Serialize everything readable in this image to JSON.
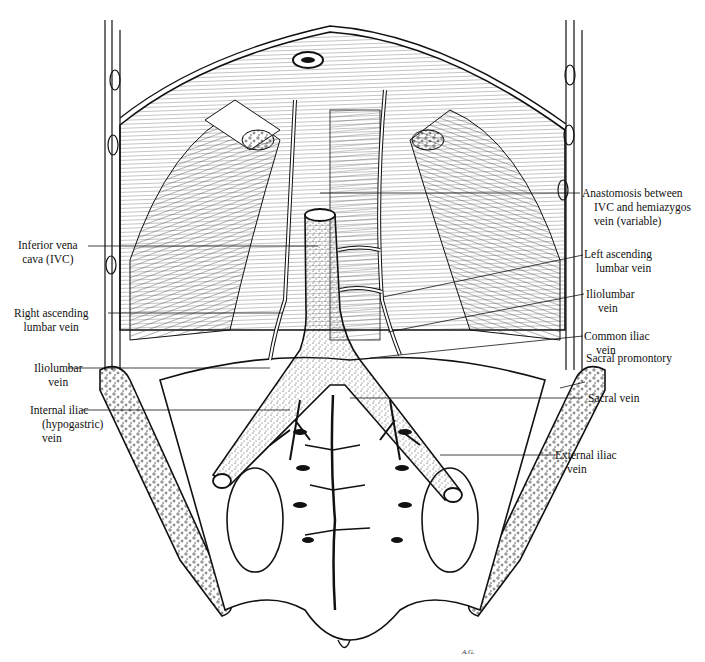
{
  "figure": {
    "artist_initials": "A.G."
  },
  "labels_left": [
    {
      "id": "ivc",
      "lines": [
        "Inferior vena",
        "cava (IVC)"
      ]
    },
    {
      "id": "right-ascending-lumbar",
      "lines": [
        "Right ascending",
        "lumbar vein"
      ]
    },
    {
      "id": "iliolumbar-left",
      "lines": [
        "Iliolumbar",
        "vein"
      ]
    },
    {
      "id": "internal-iliac",
      "lines": [
        "Internal iliac",
        "(hypogastric)",
        "vein"
      ]
    }
  ],
  "labels_right": [
    {
      "id": "anastomosis",
      "lines": [
        "Anastomosis between",
        "IVC and hemiazygos",
        "vein (variable)"
      ]
    },
    {
      "id": "left-ascending-lumbar",
      "lines": [
        "Left ascending",
        "lumbar vein"
      ]
    },
    {
      "id": "iliolumbar-right",
      "lines": [
        "Iliolumbar",
        "vein"
      ]
    },
    {
      "id": "common-iliac",
      "lines": [
        "Common iliac",
        "vein"
      ]
    },
    {
      "id": "sacral-promontory",
      "lines": [
        "Sacral promontory"
      ]
    },
    {
      "id": "sacral-vein",
      "lines": [
        "Sacral vein"
      ]
    },
    {
      "id": "external-iliac",
      "lines": [
        "External iliac",
        "vein"
      ]
    }
  ],
  "colors": {
    "ink": "#111111",
    "background": "#ffffff",
    "muscle_hatch": "#333333"
  }
}
